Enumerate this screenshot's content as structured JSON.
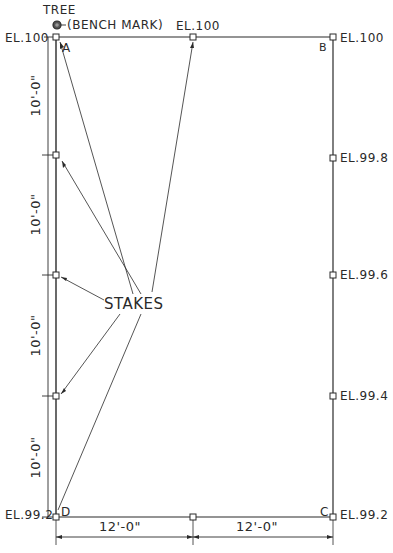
{
  "diagram": {
    "type": "site-layout-plan",
    "colors": {
      "ink": "#2a2a2a",
      "paper": "#ffffff"
    },
    "reference": {
      "tree_label": "TREE",
      "bench_mark_label": "(BENCH MARK)"
    },
    "corners": {
      "A": {
        "label": "A",
        "elevation": "EL.100"
      },
      "B": {
        "label": "B",
        "elevation": "EL.100"
      },
      "C": {
        "label": "C",
        "elevation": "EL.99.2"
      },
      "D": {
        "label": "D",
        "elevation": "EL.99.2"
      }
    },
    "top_mid_stake": {
      "elevation": "EL.100"
    },
    "right_side_elevations": [
      "EL.99.8",
      "EL.99.6",
      "EL.99.4"
    ],
    "left_dimensions": [
      "10'-0\"",
      "10'-0\"",
      "10'-0\"",
      "10'-0\""
    ],
    "bottom_dimensions": [
      "12'-0\"",
      "12'-0\""
    ],
    "callout": {
      "label": "STAKES",
      "points_to": 6
    }
  }
}
